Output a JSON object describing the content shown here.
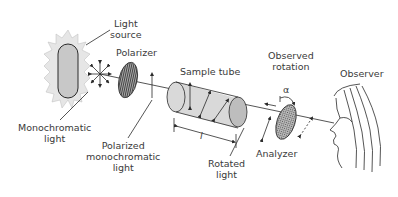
{
  "diagram": {
    "labels": {
      "light_source_1": "Light",
      "light_source_2": "source",
      "polarizer": "Polarizer",
      "sample_tube": "Sample tube",
      "observed_rotation_1": "Observed",
      "observed_rotation_2": "rotation",
      "observer": "Observer",
      "monochromatic_1": "Monochromatic",
      "monochromatic_2": "light",
      "polarized_1": "Polarized",
      "polarized_2": "monochromatic",
      "polarized_3": "light",
      "rotated_1": "Rotated",
      "rotated_2": "light",
      "analyzer": "Analyzer",
      "length_symbol": "l",
      "angle_symbol": "α"
    },
    "colors": {
      "stroke": "#2a2a2a",
      "tube_fill": "#d9d9d9",
      "tube_end": "#bdbdbd",
      "filter_fill": "#9a9a9a",
      "glow_fill": "#e6e6e6",
      "text": "#3a3a3a"
    }
  }
}
